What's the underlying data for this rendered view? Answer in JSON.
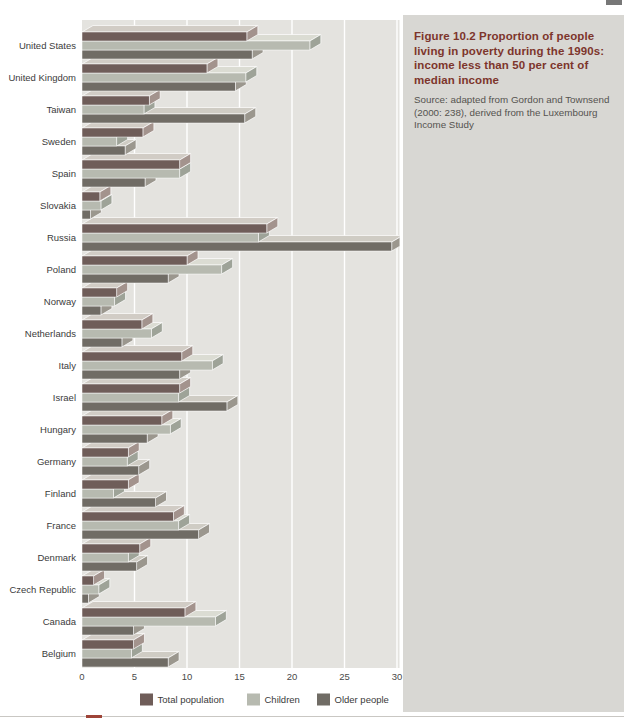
{
  "figure": {
    "title": "Figure 10.2  Proportion of people living in poverty during the 1990s: income less than 50 per cent of median income",
    "source": "Source: adapted from Gordon and Townsend (2000: 238), derived from the Luxembourg Income Study"
  },
  "chart_data": {
    "type": "bar",
    "orientation": "horizontal",
    "style": "3d-extruded",
    "title": "Figure 10.2 Proportion of people living in poverty during the 1990s: income less than 50 per cent of median income",
    "xlabel": "",
    "ylabel": "",
    "xlim": [
      0,
      30.3
    ],
    "x_ticks": [
      0,
      5,
      10,
      15,
      20,
      25,
      30
    ],
    "grid": "vertical-white-lines",
    "legend_position": "bottom",
    "plot_bg_color": "#e4e3df",
    "categories": [
      "United States",
      "United Kingdom",
      "Taiwan",
      "Sweden",
      "Spain",
      "Slovakia",
      "Russia",
      "Poland",
      "Norway",
      "Netherlands",
      "Italy",
      "Israel",
      "Hungary",
      "Germany",
      "Finland",
      "France",
      "Denmark",
      "Czech Republic",
      "Canada",
      "Belgium"
    ],
    "series": [
      {
        "name": "Total population",
        "color": "#6f5d59",
        "top_color": "#d1ccc5",
        "side_color": "#a3938d",
        "values": [
          15.7,
          11.9,
          6.4,
          5.8,
          9.3,
          1.7,
          17.6,
          10.0,
          3.3,
          5.7,
          9.5,
          9.3,
          7.6,
          4.4,
          4.4,
          8.7,
          5.5,
          1.1,
          9.8,
          4.9
        ]
      },
      {
        "name": "Children",
        "color": "#b7bab0",
        "top_color": "#dbdcd3",
        "side_color": "#9ea398",
        "values": [
          21.7,
          15.6,
          5.9,
          3.3,
          9.3,
          1.8,
          16.8,
          13.3,
          3.1,
          6.6,
          12.4,
          9.2,
          8.4,
          4.3,
          3.0,
          9.2,
          4.4,
          1.6,
          12.7,
          4.7
        ]
      },
      {
        "name": "Older people",
        "color": "#706c65",
        "top_color": "#cfccc4",
        "side_color": "#9b978e",
        "values": [
          16.2,
          14.6,
          15.5,
          4.1,
          6.0,
          0.8,
          29.5,
          8.2,
          1.8,
          3.8,
          9.3,
          13.8,
          6.2,
          5.4,
          7.0,
          11.1,
          5.2,
          0.6,
          4.9,
          8.2
        ]
      }
    ]
  }
}
